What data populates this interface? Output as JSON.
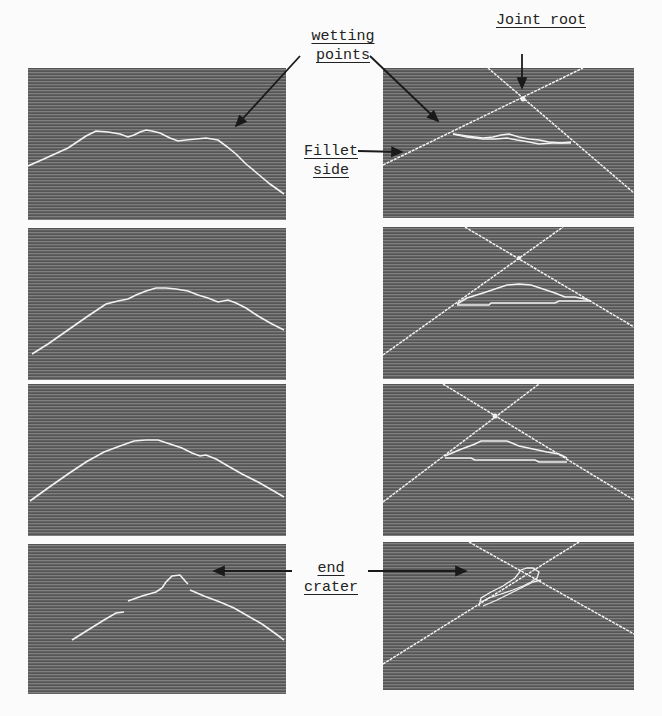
{
  "figure": {
    "panels_left_title": "weld profile scans (raw)",
    "panels_right_title": "weld profile with fitted joint lines"
  },
  "annotations": {
    "wetting_points": [
      "wetting",
      "points"
    ],
    "joint_root": "Joint root",
    "fillet_side": [
      "Fillet",
      "side"
    ],
    "end_crater": [
      "end",
      "crater"
    ]
  },
  "colors": {
    "panel_background": "#6a6a6a",
    "trace": "#f2f2f2",
    "annotation_ink": "#1a1a1a",
    "page_background": "#fbfbfb"
  },
  "panels": [
    {
      "id": "left-1",
      "row": 1,
      "side": "left",
      "content": "irregular flat-topped weld bead profile"
    },
    {
      "id": "right-1",
      "row": 1,
      "side": "right",
      "content": "bead profile between wetting points with crossing joint lines"
    },
    {
      "id": "left-2",
      "row": 2,
      "side": "left",
      "content": "rounded weld bead profile"
    },
    {
      "id": "right-2",
      "row": 2,
      "side": "right",
      "content": "rounded bead with crossing joint lines"
    },
    {
      "id": "left-3",
      "row": 3,
      "side": "left",
      "content": "smooth arched weld bead profile"
    },
    {
      "id": "right-3",
      "row": 3,
      "side": "right",
      "content": "arched bead with crossing joint lines"
    },
    {
      "id": "left-4",
      "row": 4,
      "side": "left",
      "content": "broken profile with end crater peak"
    },
    {
      "id": "right-4",
      "row": 4,
      "side": "right",
      "content": "end crater near joint root intersection"
    }
  ]
}
